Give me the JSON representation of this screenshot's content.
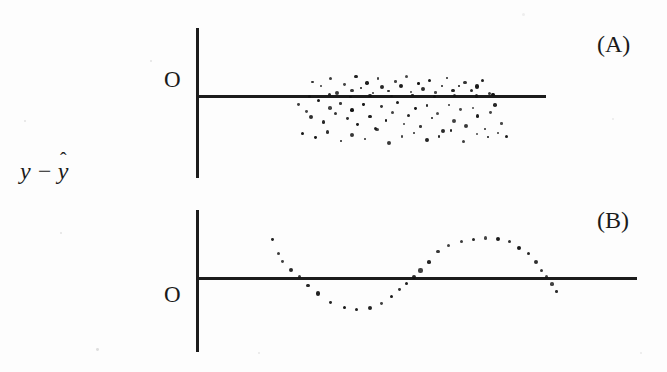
{
  "figure": {
    "type": "residual-plot-figure",
    "background": "#fdfdfd",
    "ink_color": "#111111",
    "width": 667,
    "height": 372,
    "y_axis_label_plain": "y - y-hat",
    "y_axis_label_parts": {
      "y": "y",
      "minus": "−",
      "yhat_base": "y",
      "yhat_hat": "ˆ"
    },
    "panel_a_label": "(A)",
    "panel_b_label": "(B)",
    "origin_label_a": "O",
    "origin_label_b": "O"
  },
  "chart_data": [
    {
      "type": "scatter",
      "id": "panel-a",
      "title": "(A)",
      "xlabel": "",
      "ylabel": "y − ŷ",
      "annotations": [
        "O"
      ],
      "grid": false,
      "legend": null,
      "axis_origin_px": {
        "x": 197,
        "y": 96
      },
      "axis_v_px": {
        "x": 197,
        "y_top": 28,
        "y_bottom": 178
      },
      "axis_h_px": {
        "x_left": 197,
        "x_right": 546,
        "y": 96
      },
      "description": "Random scatter of residuals about zero line; cloud biased below the line, no systematic pattern",
      "points": [
        [
          313,
          82
        ],
        [
          322,
          86
        ],
        [
          331,
          79
        ],
        [
          338,
          92
        ],
        [
          345,
          84
        ],
        [
          352,
          90
        ],
        [
          356,
          76
        ],
        [
          361,
          88
        ],
        [
          367,
          83
        ],
        [
          372,
          93
        ],
        [
          378,
          79
        ],
        [
          383,
          87
        ],
        [
          389,
          91
        ],
        [
          395,
          81
        ],
        [
          401,
          86
        ],
        [
          407,
          77
        ],
        [
          412,
          92
        ],
        [
          418,
          84
        ],
        [
          424,
          89
        ],
        [
          430,
          80
        ],
        [
          436,
          93
        ],
        [
          441,
          85
        ],
        [
          447,
          78
        ],
        [
          453,
          90
        ],
        [
          459,
          86
        ],
        [
          465,
          82
        ],
        [
          471,
          91
        ],
        [
          477,
          87
        ],
        [
          483,
          80
        ],
        [
          489,
          93
        ],
        [
          299,
          104
        ],
        [
          306,
          111
        ],
        [
          312,
          117
        ],
        [
          318,
          101
        ],
        [
          324,
          122
        ],
        [
          330,
          108
        ],
        [
          336,
          114
        ],
        [
          341,
          103
        ],
        [
          347,
          119
        ],
        [
          353,
          110
        ],
        [
          358,
          125
        ],
        [
          364,
          105
        ],
        [
          370,
          116
        ],
        [
          375,
          128
        ],
        [
          381,
          107
        ],
        [
          387,
          120
        ],
        [
          392,
          112
        ],
        [
          398,
          102
        ],
        [
          404,
          124
        ],
        [
          409,
          115
        ],
        [
          415,
          109
        ],
        [
          421,
          127
        ],
        [
          427,
          106
        ],
        [
          432,
          118
        ],
        [
          438,
          113
        ],
        [
          444,
          131
        ],
        [
          449,
          104
        ],
        [
          455,
          121
        ],
        [
          461,
          110
        ],
        [
          466,
          126
        ],
        [
          472,
          108
        ],
        [
          478,
          117
        ],
        [
          484,
          129
        ],
        [
          490,
          112
        ],
        [
          495,
          105
        ],
        [
          501,
          123
        ],
        [
          302,
          134
        ],
        [
          315,
          138
        ],
        [
          327,
          132
        ],
        [
          340,
          141
        ],
        [
          352,
          135
        ],
        [
          365,
          139
        ],
        [
          377,
          130
        ],
        [
          390,
          143
        ],
        [
          402,
          136
        ],
        [
          414,
          133
        ],
        [
          427,
          140
        ],
        [
          439,
          137
        ],
        [
          451,
          131
        ],
        [
          464,
          142
        ],
        [
          476,
          134
        ],
        [
          488,
          138
        ],
        [
          498,
          132
        ],
        [
          506,
          136
        ],
        [
          310,
          96
        ],
        [
          330,
          95
        ],
        [
          350,
          97
        ],
        [
          370,
          95
        ],
        [
          392,
          96
        ],
        [
          412,
          95
        ],
        [
          434,
          97
        ],
        [
          454,
          95
        ],
        [
          476,
          96
        ],
        [
          494,
          95
        ]
      ]
    },
    {
      "type": "scatter",
      "id": "panel-b",
      "title": "(B)",
      "xlabel": "",
      "ylabel": "y − ŷ",
      "annotations": [
        "O"
      ],
      "grid": false,
      "legend": null,
      "axis_origin_px": {
        "x": 197,
        "y": 278
      },
      "axis_v_px": {
        "x": 197,
        "y_top": 210,
        "y_bottom": 352
      },
      "axis_h_px": {
        "x_left": 197,
        "x_right": 637,
        "y": 278
      },
      "description": "Residuals follow a systematic sinusoidal pattern: start high, dip below zero, rise to an arc above zero, return toward zero",
      "points": [
        [
          273,
          240
        ],
        [
          278,
          253
        ],
        [
          283,
          262
        ],
        [
          291,
          270
        ],
        [
          299,
          277
        ],
        [
          308,
          285
        ],
        [
          318,
          294
        ],
        [
          330,
          303
        ],
        [
          344,
          308
        ],
        [
          357,
          310
        ],
        [
          370,
          308
        ],
        [
          381,
          303
        ],
        [
          391,
          297
        ],
        [
          399,
          290
        ],
        [
          406,
          283
        ],
        [
          413,
          278
        ],
        [
          421,
          270
        ],
        [
          429,
          262
        ],
        [
          438,
          252
        ],
        [
          449,
          246
        ],
        [
          461,
          242
        ],
        [
          473,
          239
        ],
        [
          485,
          238
        ],
        [
          497,
          239
        ],
        [
          509,
          242
        ],
        [
          519,
          247
        ],
        [
          528,
          254
        ],
        [
          535,
          262
        ],
        [
          541,
          270
        ],
        [
          546,
          277
        ],
        [
          551,
          284
        ],
        [
          556,
          291
        ]
      ]
    }
  ]
}
